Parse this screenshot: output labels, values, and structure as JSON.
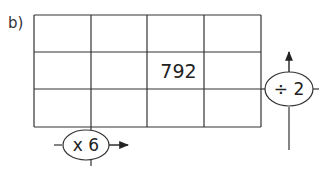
{
  "part_label": "b)",
  "grid": {
    "rows": 3,
    "cols": 4,
    "cells": [
      [
        "",
        "",
        "",
        ""
      ],
      [
        "",
        "",
        "792",
        ""
      ],
      [
        "",
        "",
        "",
        ""
      ]
    ]
  },
  "operators": {
    "column_operator": {
      "label": "x 6",
      "direction": "right"
    },
    "row_operator": {
      "label": "÷ 2",
      "direction": "up"
    }
  }
}
